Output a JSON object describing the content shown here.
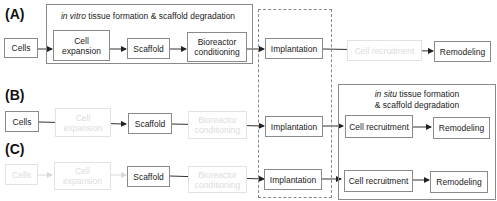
{
  "panels": {
    "A": {
      "label": "(A)",
      "group_caption_italic": "in vitro",
      "group_caption_rest": " tissue formation & scaffold degradation",
      "steps": [
        "Cells",
        "Cell expansion",
        "Scaffold",
        "Bioreactor conditioning",
        "Implantation",
        "Cell recruitment",
        "Remodeling"
      ],
      "faded_steps": [
        "Cell recruitment"
      ]
    },
    "B": {
      "label": "(B)",
      "group_caption_italic": "in situ",
      "group_caption_rest": " tissue formation",
      "group_caption_line2": "& scaffold degradation",
      "steps": [
        "Cells",
        "Cell expansion",
        "Scaffold",
        "Bioreactor conditioning",
        "Implantation",
        "Cell recruitment",
        "Remodeling"
      ],
      "faded_steps": [
        "Cell expansion",
        "Bioreactor conditioning"
      ]
    },
    "C": {
      "label": "(C)",
      "steps": [
        "Cells",
        "Cell expansion",
        "Scaffold",
        "Bioreactor conditioning",
        "Implantation",
        "Cell recruitment",
        "Remodeling"
      ],
      "faded_steps": [
        "Cells",
        "Cell expansion",
        "Bioreactor conditioning"
      ]
    }
  },
  "texts": {
    "cells": "Cells",
    "cell_expansion_1": "Cell",
    "cell_expansion_2": "expansion",
    "scaffold": "Scaffold",
    "bioreactor_1": "Bioreactor",
    "bioreactor_2": "conditioning",
    "implantation": "Implantation",
    "cell_recruitment": "Cell recruitment",
    "remodeling": "Remodeling"
  },
  "colors": {
    "line": "#333333",
    "box_border": "#8a8a8a",
    "faded": "#dcdcdc"
  }
}
